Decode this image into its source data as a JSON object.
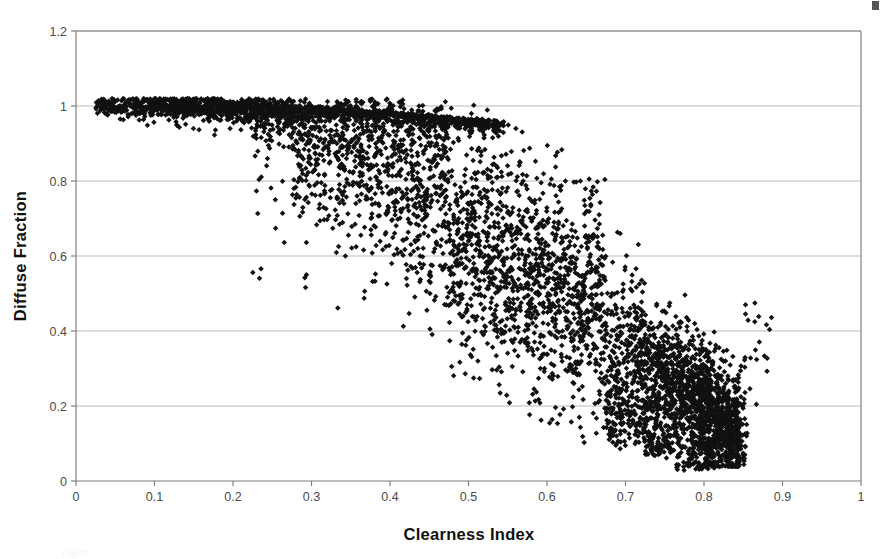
{
  "figure": {
    "background_color": "#ffffff",
    "marker_color": "#111111",
    "axis_color": "#808080",
    "grid_color": "#b9b9b9",
    "corner_artifact": "scan-speck"
  },
  "caption": {
    "partial_text": "Figure"
  },
  "chart_data": {
    "type": "scatter",
    "title": "",
    "xlabel": "Clearness Index",
    "ylabel": "Diffuse Fraction",
    "xlim": [
      0,
      1
    ],
    "ylim": [
      0,
      1.2
    ],
    "xticks": [
      "0",
      "0.1",
      "0.2",
      "0.3",
      "0.4",
      "0.5",
      "0.6",
      "0.7",
      "0.8",
      "0.9",
      "1"
    ],
    "xtick_values": [
      0,
      0.1,
      0.2,
      0.3,
      0.4,
      0.5,
      0.6,
      0.7,
      0.8,
      0.9,
      1
    ],
    "yticks": [
      "0",
      "0.2",
      "0.4",
      "0.6",
      "0.8",
      "1",
      "1.2"
    ],
    "ytick_values": [
      0,
      0.2,
      0.4,
      0.6,
      0.8,
      1.0,
      1.2
    ],
    "grid": {
      "horizontal": true,
      "vertical": false
    },
    "legend": {
      "visible": false,
      "position": "none"
    },
    "marker": {
      "shape": "diamond",
      "size_px": 5.5,
      "color": "#111111"
    },
    "series": [
      {
        "name": "Diffuse fraction vs clearness index",
        "n_points_approx": 4000,
        "description": "Dense scatter forming a characteristic falling-sigmoid cloud: near unity diffuse fraction at low clearness index (Kt<0.25), steep decline between Kt 0.3 and 0.75, narrow low-diffuse tail near Kt 0.8.",
        "x_range_observed": [
          0.025,
          0.885
        ],
        "y_range_observed": [
          0.03,
          1.02
        ],
        "summary_bins": [
          {
            "kt": 0.05,
            "kd_mean": 1.0,
            "kd_min": 0.97,
            "kd_max": 1.02,
            "count": 60
          },
          {
            "kt": 0.1,
            "kd_mean": 0.995,
            "kd_min": 0.93,
            "kd_max": 1.02,
            "count": 120
          },
          {
            "kt": 0.15,
            "kd_mean": 0.99,
            "kd_min": 0.9,
            "kd_max": 1.02,
            "count": 150
          },
          {
            "kt": 0.2,
            "kd_mean": 0.985,
            "kd_min": 0.88,
            "kd_max": 1.01,
            "count": 170
          },
          {
            "kt": 0.25,
            "kd_mean": 0.975,
            "kd_min": 0.75,
            "kd_max": 1.01,
            "count": 190
          },
          {
            "kt": 0.3,
            "kd_mean": 0.96,
            "kd_min": 0.62,
            "kd_max": 1.01,
            "count": 210
          },
          {
            "kt": 0.35,
            "kd_mean": 0.93,
            "kd_min": 0.55,
            "kd_max": 1.01,
            "count": 230
          },
          {
            "kt": 0.4,
            "kd_mean": 0.88,
            "kd_min": 0.44,
            "kd_max": 1.01,
            "count": 250
          },
          {
            "kt": 0.45,
            "kd_mean": 0.82,
            "kd_min": 0.33,
            "kd_max": 1.0,
            "count": 270
          },
          {
            "kt": 0.5,
            "kd_mean": 0.74,
            "kd_min": 0.27,
            "kd_max": 0.99,
            "count": 290
          },
          {
            "kt": 0.55,
            "kd_mean": 0.65,
            "kd_min": 0.22,
            "kd_max": 0.95,
            "count": 300
          },
          {
            "kt": 0.6,
            "kd_mean": 0.55,
            "kd_min": 0.17,
            "kd_max": 0.88,
            "count": 310
          },
          {
            "kt": 0.65,
            "kd_mean": 0.45,
            "kd_min": 0.13,
            "kd_max": 0.8,
            "count": 320
          },
          {
            "kt": 0.7,
            "kd_mean": 0.34,
            "kd_min": 0.1,
            "kd_max": 0.68,
            "count": 330
          },
          {
            "kt": 0.75,
            "kd_mean": 0.23,
            "kd_min": 0.07,
            "kd_max": 0.52,
            "count": 300
          },
          {
            "kt": 0.8,
            "kd_mean": 0.15,
            "kd_min": 0.04,
            "kd_max": 0.4,
            "count": 220
          },
          {
            "kt": 0.84,
            "kd_mean": 0.12,
            "kd_min": 0.05,
            "kd_max": 0.33,
            "count": 90
          },
          {
            "kt": 0.87,
            "kd_mean": 0.26,
            "kd_min": 0.22,
            "kd_max": 0.45,
            "count": 8
          }
        ]
      }
    ]
  }
}
